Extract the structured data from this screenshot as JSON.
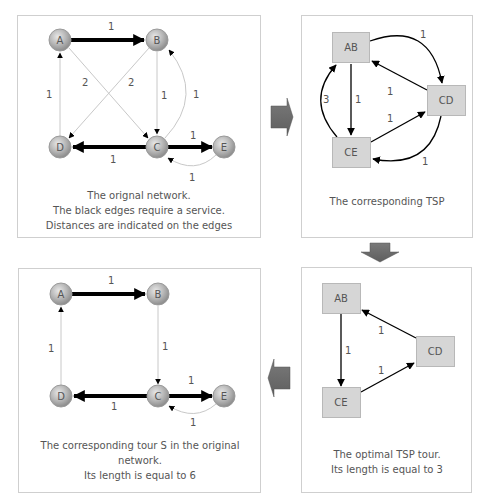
{
  "panels": {
    "original_network": {
      "caption_lines": [
        "The orignal network.",
        "The black edges require a service.",
        "Distances are indicated on the edges"
      ],
      "nodes": [
        "A",
        "B",
        "C",
        "D",
        "E"
      ],
      "edges": [
        {
          "from": "A",
          "to": "B",
          "weight": "1",
          "required": true
        },
        {
          "from": "A",
          "to": "C",
          "weight": "2",
          "required": false
        },
        {
          "from": "B",
          "to": "D",
          "weight": "2",
          "required": false
        },
        {
          "from": "B",
          "to": "C",
          "weight": "1",
          "required": false
        },
        {
          "from": "C",
          "to": "B",
          "weight": "1",
          "required": false
        },
        {
          "from": "D",
          "to": "A",
          "weight": "1",
          "required": false
        },
        {
          "from": "C",
          "to": "D",
          "weight": "1",
          "required": true
        },
        {
          "from": "C",
          "to": "E",
          "weight": "1",
          "required": true
        },
        {
          "from": "E",
          "to": "C",
          "weight": "1",
          "required": false
        }
      ]
    },
    "corresponding_tsp": {
      "caption_lines": [
        "The corresponding TSP"
      ],
      "nodes": [
        "AB",
        "CD",
        "CE"
      ],
      "edges": [
        {
          "from": "AB",
          "to": "CD",
          "weight": "1"
        },
        {
          "from": "CD",
          "to": "AB",
          "weight": "1"
        },
        {
          "from": "AB",
          "to": "CE",
          "weight": "1"
        },
        {
          "from": "CE",
          "to": "AB",
          "weight": "3"
        },
        {
          "from": "CE",
          "to": "CD",
          "weight": "1"
        },
        {
          "from": "CD",
          "to": "CE",
          "weight": "1"
        }
      ]
    },
    "optimal_tsp_tour": {
      "caption_lines": [
        "The optimal TSP tour.",
        "Its length is equal to 3"
      ],
      "nodes": [
        "AB",
        "CD",
        "CE"
      ],
      "edges": [
        {
          "from": "AB",
          "to": "CE",
          "weight": "1"
        },
        {
          "from": "CE",
          "to": "CD",
          "weight": "1"
        },
        {
          "from": "CD",
          "to": "AB",
          "weight": "1"
        }
      ]
    },
    "tour_in_original": {
      "caption_lines": [
        "The corresponding tour S in the original",
        "network.",
        "Its length is equal to 6"
      ],
      "nodes": [
        "A",
        "B",
        "C",
        "D",
        "E"
      ],
      "edges": [
        {
          "from": "A",
          "to": "B",
          "weight": "1",
          "required": true
        },
        {
          "from": "B",
          "to": "C",
          "weight": "1",
          "required": false
        },
        {
          "from": "C",
          "to": "D",
          "weight": "1",
          "required": true
        },
        {
          "from": "D",
          "to": "A",
          "weight": "1",
          "required": false
        },
        {
          "from": "C",
          "to": "E",
          "weight": "1",
          "required": true
        },
        {
          "from": "E",
          "to": "C",
          "weight": "1",
          "required": false
        }
      ]
    }
  },
  "flow_arrows": [
    "right-arrow",
    "down-arrow",
    "left-arrow"
  ],
  "colors": {
    "panel_border": "#cfcfcf",
    "node_fill": "#b5b5b5",
    "tsp_box_fill": "#d6d6d6",
    "tsp_box_border": "#b8b8b8",
    "flow_arrow_fill": "#6e6e6e",
    "thin_edge": "#c8c8c8"
  }
}
